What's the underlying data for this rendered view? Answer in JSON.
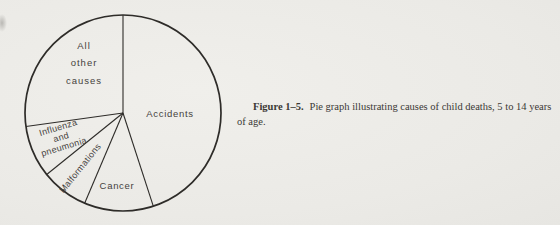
{
  "figure": {
    "caption_label": "Figure 1–5.",
    "caption_text": "Pie graph illustrating causes of child deaths, 5 to 14 years of age."
  },
  "chart_data": {
    "type": "pie",
    "title": "Causes of child deaths, 5 to 14 years of age",
    "categories": [
      "Accidents",
      "Cancer",
      "Malformations",
      "Influenza and pneumonia",
      "All other causes"
    ],
    "values_pct": [
      45.0,
      11.4,
      7.8,
      8.6,
      27.2
    ],
    "start_angle_deg": 0,
    "direction": "clockwise",
    "stroke_color": "#2e2c29",
    "label_color": "#45423d",
    "geometry": {
      "cx": 123,
      "cy": 113,
      "r": 98,
      "circle_stroke_width": 1.7,
      "line_stroke_width": 1.1
    },
    "labels": [
      {
        "text": "Accidents",
        "lines": [
          "Accidents"
        ],
        "x": 170,
        "y": 114,
        "rotation": 0,
        "fs": 9.5,
        "ls": 0.7,
        "lh": 17
      },
      {
        "text": "Cancer",
        "lines": [
          "Cancer"
        ],
        "x": 117,
        "y": 186,
        "rotation": 0,
        "fs": 9.5,
        "ls": 0.7,
        "lh": 17
      },
      {
        "text": "Malformations",
        "lines": [
          "Malformations"
        ],
        "x": 80,
        "y": 168,
        "rotation": -51,
        "fs": 9,
        "ls": 0.3,
        "lh": 10
      },
      {
        "text": "Influenza and pneumonia",
        "lines": [
          "Influenza",
          "and",
          "pneumonia"
        ],
        "x": 61,
        "y": 137,
        "rotation": -17,
        "fs": 9,
        "ls": 0.3,
        "lh": 10
      },
      {
        "text": "All other causes",
        "lines": [
          "All",
          "other",
          "causes"
        ],
        "x": 84,
        "y": 63,
        "rotation": 0,
        "fs": 9.5,
        "ls": 1.0,
        "lh": 17.5
      }
    ]
  }
}
